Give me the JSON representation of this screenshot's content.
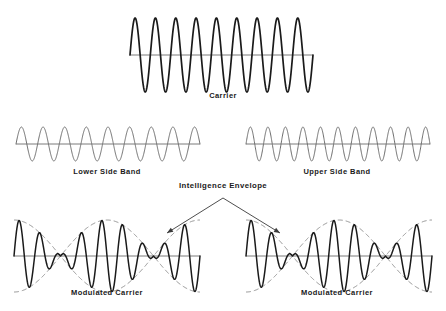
{
  "figure": {
    "width": 446,
    "height": 311,
    "background_color": "#ffffff"
  },
  "colors": {
    "wave_dark": "#1a1a1a",
    "wave_gray": "#6e6e6e",
    "axis_gray": "#7a7a7a",
    "envelope_dash": "#8a8a8a",
    "arrow": "#3a3a3a",
    "text": "#1a1a1a"
  },
  "labels": {
    "carrier": "Carrier",
    "lower_side_band": "Lower Side Band",
    "upper_side_band": "Upper Side Band",
    "intelligence_envelope": "Intelligence Envelope",
    "modulated_carrier_left": "Modulated Carrier",
    "modulated_carrier_right": "Modulated Carrier"
  },
  "chart_data": {
    "type": "line",
    "xlabel": "",
    "ylabel": "",
    "grid": false,
    "legend": "none",
    "panels": [
      {
        "name": "carrier",
        "label": "Carrier",
        "x_range": [
          130,
          313
        ],
        "baseline_y": 55,
        "amplitude": 37,
        "cycles": 9,
        "stroke": "#1a1a1a",
        "stroke_width": 1.7,
        "axis": true,
        "envelope": false
      },
      {
        "name": "lower-side-band",
        "label": "Lower Side Band",
        "x_range": [
          16,
          200
        ],
        "baseline_y": 144,
        "amplitude": 17,
        "cycles": 8.5,
        "stroke": "#6e6e6e",
        "stroke_width": 1.0,
        "axis": true,
        "envelope": false
      },
      {
        "name": "upper-side-band",
        "label": "Upper Side Band",
        "x_range": [
          246,
          430
        ],
        "baseline_y": 144,
        "amplitude": 17,
        "cycles": 10.5,
        "stroke": "#6e6e6e",
        "stroke_width": 1.0,
        "axis": true,
        "envelope": false
      },
      {
        "name": "modulated-carrier-left",
        "label": "Modulated Carrier",
        "x_range": [
          14,
          200
        ],
        "baseline_y": 256,
        "amplitude": 36,
        "cycles": 9,
        "beat_cycles": 1,
        "stroke": "#1a1a1a",
        "stroke_width": 1.5,
        "axis": true,
        "envelope": true,
        "envelope_stroke": "#8a8a8a",
        "envelope_dash": "5,3"
      },
      {
        "name": "modulated-carrier-right",
        "label": "Modulated Carrier",
        "x_range": [
          246,
          432
        ],
        "baseline_y": 256,
        "amplitude": 36,
        "cycles": 9,
        "beat_cycles": 1,
        "stroke": "#1a1a1a",
        "stroke_width": 1.5,
        "axis": true,
        "envelope": true,
        "envelope_stroke": "#8a8a8a",
        "envelope_dash": "5,3"
      }
    ],
    "annotations": [
      {
        "name": "intelligence-envelope",
        "text": "Intelligence Envelope",
        "text_x": 223,
        "text_y": 186,
        "apex": [
          223,
          198
        ],
        "arrows": [
          {
            "from": [
              223,
              198
            ],
            "to": [
              167,
              233
            ]
          },
          {
            "from": [
              223,
              198
            ],
            "to": [
              280,
              233
            ]
          }
        ]
      }
    ]
  },
  "caption_positions": {
    "carrier": {
      "x": 223,
      "y": 92
    },
    "lower_side_band": {
      "x": 107,
      "y": 168
    },
    "upper_side_band": {
      "x": 337,
      "y": 168
    },
    "intelligence_envelope": {
      "x": 223,
      "y": 182
    },
    "modulated_carrier_left": {
      "x": 107,
      "y": 289
    },
    "modulated_carrier_right": {
      "x": 337,
      "y": 289
    }
  }
}
